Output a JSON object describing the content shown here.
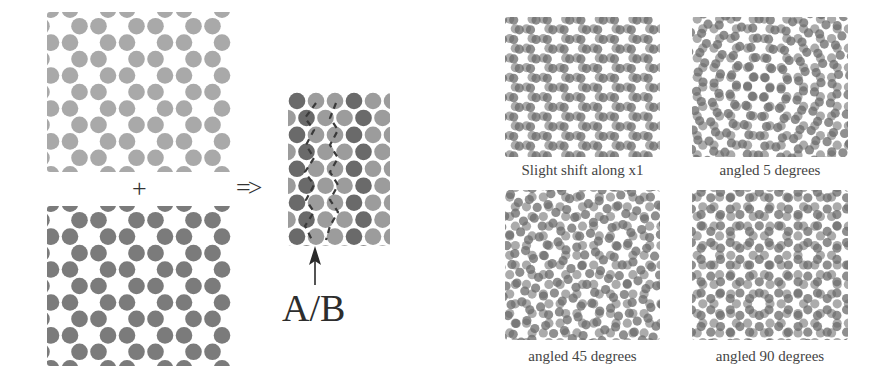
{
  "figure": {
    "operator_plus": "+",
    "operator_arrow": "=>",
    "interface_label": "A/B",
    "colors": {
      "lattice_a": "#a9a9a9",
      "lattice_b": "#7b7b7b",
      "overlay_dark": "#6a6a6a",
      "overlay_light": "#9c9c9c",
      "dash": "#3a3a3a",
      "arrow": "#2a2a2a"
    },
    "panels": {
      "lattice_a": {
        "name": "top honeycomb lattice (light)",
        "x": 47,
        "y": 12,
        "w": 185,
        "h": 160
      },
      "lattice_b": {
        "name": "bottom honeycomb lattice (dark)",
        "x": 47,
        "y": 206,
        "w": 185,
        "h": 160
      },
      "combined": {
        "name": "combined A/B interface",
        "x": 288,
        "y": 92,
        "w": 102,
        "h": 154
      }
    },
    "moire": [
      {
        "caption": "Slight shift along x1",
        "angle": 0,
        "shift": 4,
        "x": 505,
        "y": 17,
        "w": 155,
        "h": 140
      },
      {
        "caption": "angled 5 degrees",
        "angle": 5,
        "shift": 0,
        "x": 692,
        "y": 17,
        "w": 156,
        "h": 140
      },
      {
        "caption": "angled 45 degrees",
        "angle": 45,
        "shift": 0,
        "x": 505,
        "y": 190,
        "w": 155,
        "h": 150
      },
      {
        "caption": "angled 90 degrees",
        "angle": 90,
        "shift": 0,
        "x": 692,
        "y": 190,
        "w": 156,
        "h": 150
      }
    ]
  }
}
